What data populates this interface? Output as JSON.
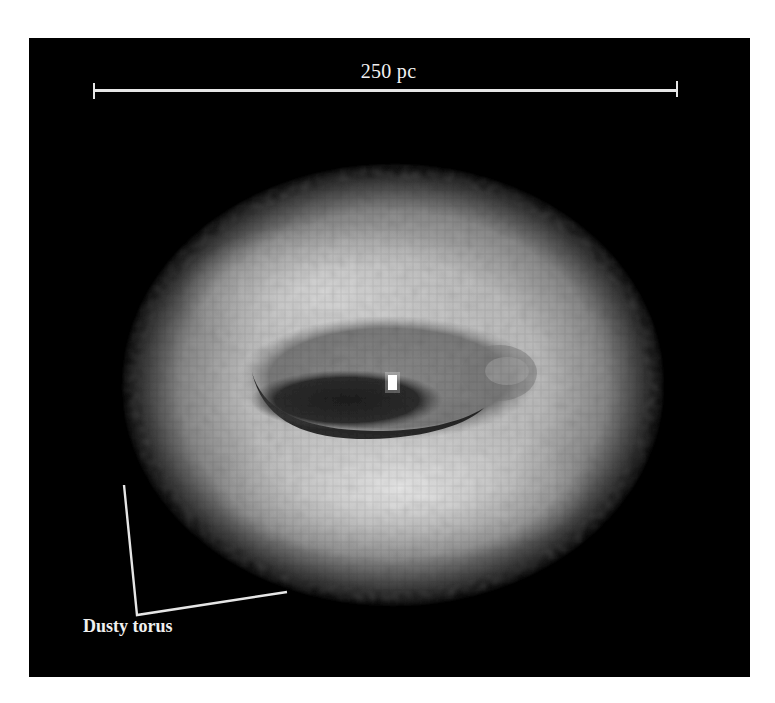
{
  "figure": {
    "scale_bar": {
      "label": "250 pc"
    },
    "callout": {
      "label": "Dusty torus"
    },
    "subject": {
      "description": "pixelated grayscale image of an active galactic nucleus surrounded by a bright dusty torus with a dark inner region and a bright central point",
      "icon": "torus-image"
    },
    "colors": {
      "background": "#000000",
      "page": "#ffffff",
      "annotation": "#e6e6e6",
      "torus_peak": "#e4e4e4",
      "inner_dark": "#2a2a2a",
      "nucleus": "#ffffff"
    }
  }
}
